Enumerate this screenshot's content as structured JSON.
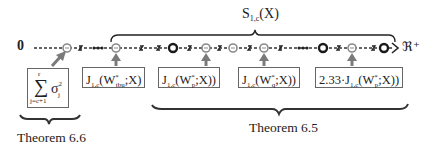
{
  "axis": {
    "origin_label": "0",
    "end_label": "ℜ⁺"
  },
  "top_brace": {
    "label_main": "S",
    "label_sub": "1,c",
    "label_arg": "(X)"
  },
  "boxes": {
    "sum": {
      "sigma_symbol": "∑",
      "upper": "r",
      "lower": "j=c+1",
      "term": "σ",
      "term_sup": "2",
      "term_sub": "j"
    },
    "tbu": {
      "prefix": "J",
      "sub": "1,c",
      "open": "(W",
      "star": "*",
      "wsub": "tbu",
      "rest": ";X)"
    },
    "p": {
      "prefix": "J",
      "sub": "1,c",
      "open": "(W",
      "star": "*",
      "wsub": "p",
      "rest": ";X))"
    },
    "q": {
      "prefix": "J",
      "sub": "1,c",
      "open": "(W",
      "star": "*",
      "wsub": "q",
      "rest": ";X))"
    },
    "scaled": {
      "coef": "2.33·",
      "prefix": "J",
      "sub": "1,c",
      "open": "(W",
      "star": "*",
      "wsub": "p",
      "rest": ";X))"
    }
  },
  "bottom_braces": {
    "left_label": "Theorem 6.6",
    "right_label": "Theorem 6.5"
  },
  "colors": {
    "gray_marker": "#8a8a8a",
    "dark_marker": "#1a1a1a",
    "arrow": "#7a7a7a",
    "line": "#333333"
  }
}
